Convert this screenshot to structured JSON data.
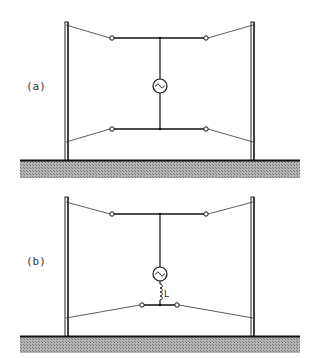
{
  "figure": {
    "panels": [
      {
        "id": "a",
        "label": "(a)",
        "description": "Two-pole antenna with generator between upper and lower horizontal bars",
        "components": [
          "generator"
        ]
      },
      {
        "id": "b",
        "label": "(b)",
        "description": "Two-pole antenna with generator and series inductor feeding short lower bar",
        "components": [
          "generator",
          "inductor"
        ],
        "inductor_label": "L"
      }
    ],
    "colors": {
      "line": "#1a1a1a",
      "thin_line": "#333333",
      "ground_hatch": "#8a8a8a",
      "background": "#ffffff"
    }
  }
}
